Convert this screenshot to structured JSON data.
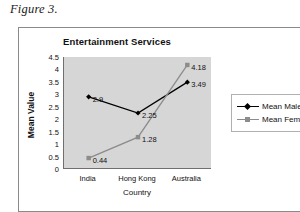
{
  "caption": "Figure 3.",
  "chart_data": {
    "type": "line",
    "title": "Entertainment Services",
    "xlabel": "Country",
    "ylabel": "Mean Value",
    "categories": [
      "India",
      "Hong Kong",
      "Australia"
    ],
    "ylim": [
      0,
      4.5
    ],
    "yticks": [
      "0",
      "0.5",
      "1",
      "1.5",
      "2",
      "2.5",
      "3",
      "3.5",
      "4",
      "4.5"
    ],
    "ytick_values": [
      0,
      0.5,
      1,
      1.5,
      2,
      2.5,
      3,
      3.5,
      4,
      4.5
    ],
    "grid": false,
    "legend_position": "right",
    "plot_background": "#d6d6d6",
    "series": [
      {
        "name": "Mean Male",
        "color": "#000000",
        "marker": "diamond",
        "values": [
          2.9,
          2.25,
          3.49
        ],
        "labels": [
          "2.9",
          "2.25",
          "3.49"
        ]
      },
      {
        "name": "Mean Female",
        "color": "#8c8c8c",
        "marker": "square",
        "values": [
          0.44,
          1.28,
          4.18
        ],
        "labels": [
          "0.44",
          "1.28",
          "4.18"
        ]
      }
    ]
  }
}
